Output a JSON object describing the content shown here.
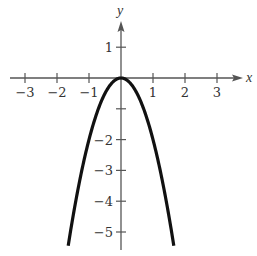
{
  "chart_data": {
    "type": "line",
    "title": "",
    "function": "y = -2x^2",
    "xlabel": "x",
    "ylabel": "y",
    "xlim": [
      -3.5,
      3.8
    ],
    "ylim": [
      -5.5,
      1.8
    ],
    "x_ticks": [
      -3,
      -2,
      -1,
      1,
      2,
      3
    ],
    "x_tick_labels": [
      "−3",
      "−2",
      "−1",
      "1",
      "2",
      "3"
    ],
    "y_ticks": [
      1,
      -1,
      -2,
      -3,
      -4,
      -5
    ],
    "y_tick_labels": [
      "1",
      "",
      "−2",
      "−3",
      "−4",
      "−5"
    ],
    "grid": false,
    "legend": null,
    "series": [
      {
        "name": "parabola",
        "color": "#111111",
        "x": [
          -1.65,
          -1.5,
          -1.25,
          -1.0,
          -0.75,
          -0.5,
          -0.25,
          0,
          0.25,
          0.5,
          0.75,
          1.0,
          1.25,
          1.5,
          1.65
        ],
        "y": [
          -5.45,
          -4.5,
          -3.125,
          -2.0,
          -1.125,
          -0.5,
          -0.125,
          0,
          -0.125,
          -0.5,
          -1.125,
          -2.0,
          -3.125,
          -4.5,
          -5.45
        ]
      }
    ]
  },
  "colors": {
    "axis": "#555555",
    "curve": "#111111",
    "text": "#333333"
  }
}
